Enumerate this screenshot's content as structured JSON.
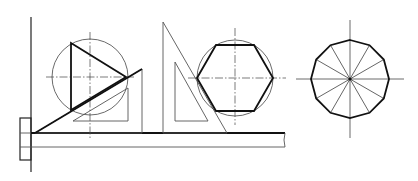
{
  "figure": {
    "colors": {
      "line_dark": "#111111",
      "line_light": "#555555",
      "background": "#ffffff"
    },
    "panels": [
      {
        "name": "inscribed-triangle",
        "shape": "equilateral triangle inscribed in circle",
        "center": [
          90,
          77
        ],
        "radius": 38
      },
      {
        "name": "inscribed-hexagon",
        "shape": "regular hexagon inscribed in circle",
        "center": [
          235,
          78
        ],
        "radius": 38
      },
      {
        "name": "inscribed-dodecagon",
        "shape": "regular 12-gon inscribed in circle",
        "center": [
          350,
          79
        ],
        "radius": 39,
        "sides": 12
      }
    ],
    "tools": [
      "drawing-board-edge",
      "t-square",
      "30-60-set-square",
      "tall-set-square"
    ]
  }
}
